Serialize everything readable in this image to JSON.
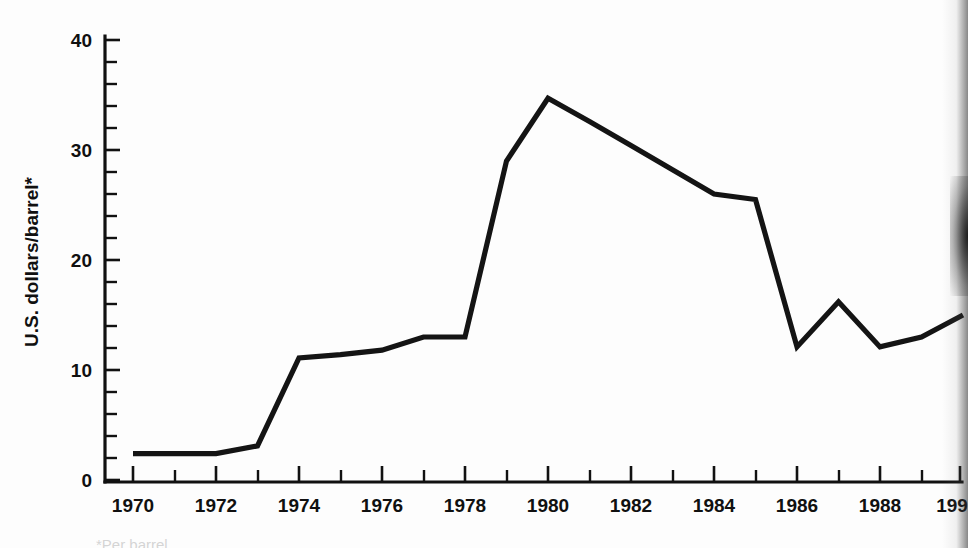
{
  "chart_data": {
    "type": "line",
    "title": "",
    "subtitle": "",
    "xlabel": "",
    "ylabel": "U.S. dollars/barrel*",
    "xlim": [
      1969.3,
      1990.4
    ],
    "ylim": [
      0,
      41
    ],
    "grid": false,
    "legend": "none",
    "x_tick_labels": [
      "1970",
      "1972",
      "1974",
      "1976",
      "1978",
      "1980",
      "1982",
      "1984",
      "1986",
      "1988",
      "199"
    ],
    "x_tick_values": [
      1970,
      1972,
      1974,
      1976,
      1978,
      1980,
      1982,
      1984,
      1986,
      1988,
      1990
    ],
    "x_minor_step": 1,
    "y_tick_labels": [
      "0",
      "10",
      "20",
      "30",
      "40"
    ],
    "y_tick_values": [
      0,
      10,
      20,
      30,
      40
    ],
    "y_minor_step": 2,
    "series": [
      {
        "name": "Crude oil price",
        "x": [
          1970,
          1971,
          1972,
          1973,
          1974,
          1975,
          1976,
          1977,
          1978,
          1979,
          1980,
          1981,
          1982,
          1983,
          1984,
          1985,
          1986,
          1987,
          1988,
          1989,
          1990
        ],
        "values": [
          2.4,
          2.4,
          2.4,
          3.1,
          11.1,
          11.4,
          11.8,
          13.0,
          13.0,
          29.0,
          34.7,
          32.6,
          30.4,
          28.2,
          26.0,
          25.5,
          12.1,
          16.2,
          12.1,
          13.0,
          15.0
        ]
      }
    ],
    "annotations": [],
    "footnote": "*Per barrel…"
  },
  "axes": {
    "y_axis_label": "U.S. dollars/barrel*"
  }
}
